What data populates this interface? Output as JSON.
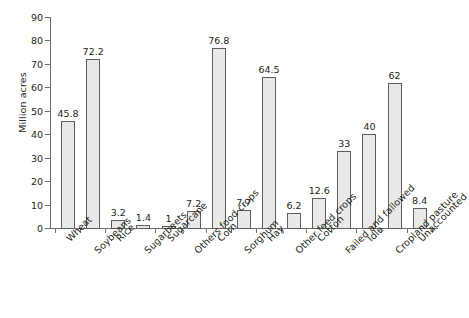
{
  "chart_data": {
    "type": "bar",
    "title": "",
    "xlabel": "",
    "ylabel": "Million acres",
    "ylim": [
      0,
      90
    ],
    "yticks": [
      0,
      10,
      20,
      30,
      40,
      50,
      60,
      70,
      80,
      90
    ],
    "grid": false,
    "legend": "none",
    "categories": [
      "Wheat",
      "Soybeans",
      "Rice",
      "Sugarbeets",
      "Sugarcane",
      "Others food crops",
      "Corn",
      "Sorghum",
      "Hay",
      "Other feed crops",
      "Cotton",
      "Failed and fallowed",
      "Idle",
      "Cropland pasture",
      "Unaccounted"
    ],
    "values": [
      45.8,
      72.2,
      3.2,
      1.4,
      1,
      7.2,
      76.8,
      7.7,
      64.5,
      6.2,
      12.6,
      33,
      40,
      62,
      8.4
    ],
    "value_labels": [
      "45.8",
      "72.2",
      "3.2",
      "1.4",
      "1",
      "7.2",
      "76.8",
      "7.7",
      "64.5",
      "6.2",
      "12.6",
      "33",
      "40",
      "62",
      "8.4"
    ],
    "bar_fill": "#e9e9e9",
    "bar_stroke": "#5d5d5d",
    "axis_color": "#6e6e6e",
    "text_color": "#231f20",
    "background": "#ffffff"
  }
}
